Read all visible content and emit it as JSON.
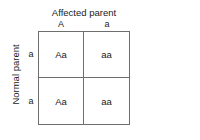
{
  "diagram": {
    "type": "punnett-square",
    "column_axis": {
      "title": "Affected parent",
      "alleles": [
        "A",
        "a"
      ]
    },
    "row_axis": {
      "title": "Normal parent",
      "alleles": [
        "a",
        "a"
      ]
    },
    "cells": [
      [
        "Aa",
        "aa"
      ],
      [
        "Aa",
        "aa"
      ]
    ],
    "colors": {
      "background": "#ffffff",
      "grid_line": "#6e6e6e",
      "text": "#1a1a1a"
    }
  }
}
